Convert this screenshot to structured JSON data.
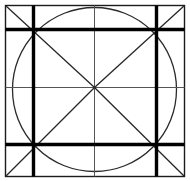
{
  "figure": {
    "background_color": "#ffffff",
    "ink_color": "#000000",
    "canvas": {
      "width": 190,
      "height": 181
    },
    "outer_square": {
      "name": "outer-square",
      "left": 5.5,
      "top": 5.5,
      "right": 184.5,
      "bottom": 176.5,
      "stroke_width": 1.4,
      "color": "#1b1b1b"
    },
    "inner_square": {
      "name": "inner-thick-square",
      "left": 33.5,
      "top": 29.5,
      "right": 156.5,
      "bottom": 144.5,
      "stroke_width": 3.4,
      "color": "#000000"
    },
    "circle": {
      "name": "inscribed-circle",
      "center_x": 94.5,
      "center_y": 89.5,
      "radius_x": 82,
      "radius_y": 82,
      "stroke_width": 1.3,
      "color": "#2a2a2a"
    },
    "center_point": {
      "x": 94.5,
      "y": 87.5
    },
    "mid_lines": {
      "name": "center-cross",
      "horizontal_y": 87.5,
      "vertical_x": 94.5,
      "stroke_width": 1.0,
      "color": "#555555"
    },
    "diagonals": {
      "name": "corner-diagonals",
      "stroke_width": 1.3,
      "color": "#262626",
      "segments": [
        {
          "label": "top-left-to-center",
          "x1": 5.5,
          "y1": 5.5,
          "x2": 94.5,
          "y2": 87.5
        },
        {
          "label": "top-right-to-center",
          "x1": 184.5,
          "y1": 5.5,
          "x2": 94.5,
          "y2": 87.5
        },
        {
          "label": "bottom-left-to-center",
          "x1": 5.5,
          "y1": 176.5,
          "x2": 94.5,
          "y2": 87.5
        },
        {
          "label": "bottom-right-to-center",
          "x1": 184.5,
          "y1": 176.5,
          "x2": 94.5,
          "y2": 87.5
        }
      ]
    },
    "thick_verticals": {
      "name": "thick-vertical-rules",
      "stroke_width": 3.4,
      "color": "#000000",
      "x_positions": [
        33.5,
        156.5
      ],
      "y_start": 5.5,
      "y_end": 176.5
    },
    "thick_horizontals": {
      "name": "thick-horizontal-rules",
      "stroke_width": 3.4,
      "color": "#000000",
      "y_positions": [
        29.5,
        144.5
      ],
      "x_start": 5.5,
      "x_end": 184.5
    },
    "intersection_nodes": [
      {
        "name": "node-top-left",
        "x": 33.5,
        "y": 29.5
      },
      {
        "name": "node-top-right",
        "x": 156.5,
        "y": 29.5
      },
      {
        "name": "node-bottom-left",
        "x": 33.5,
        "y": 144.5
      },
      {
        "name": "node-bottom-right",
        "x": 156.5,
        "y": 144.5
      }
    ]
  }
}
